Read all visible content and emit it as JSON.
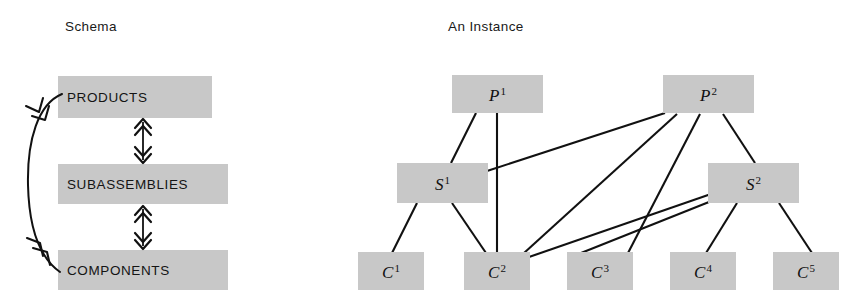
{
  "panels": [
    {
      "id": "schema",
      "title": "Schema"
    },
    {
      "id": "instance",
      "title": "An Instance"
    }
  ],
  "colors": {
    "node_fill": "#c8c8c8",
    "line": "#111111",
    "text": "#141414",
    "background": "#ffffff"
  },
  "schema": {
    "title": "Schema",
    "nodes": [
      {
        "name": "products-node",
        "label": "PRODUCTS",
        "x": 58,
        "y": 76,
        "w": 154,
        "h": 42
      },
      {
        "name": "subassemblies-node",
        "label": "SUBASSEMBLIES",
        "x": 58,
        "y": 164,
        "w": 170,
        "h": 40
      },
      {
        "name": "components-node",
        "label": "COMPONENTS",
        "x": 58,
        "y": 250,
        "w": 170,
        "h": 40
      }
    ],
    "connectors": [
      {
        "name": "products-subassemblies-connector",
        "from": "PRODUCTS",
        "to": "SUBASSEMBLIES",
        "style": "double-headed-double-chevron"
      },
      {
        "name": "subassemblies-components-connector",
        "from": "SUBASSEMBLIES",
        "to": "COMPONENTS",
        "style": "double-headed-double-chevron"
      },
      {
        "name": "products-components-connector",
        "from": "PRODUCTS",
        "to": "COMPONENTS",
        "style": "curved-double-headed-double-chevron"
      }
    ]
  },
  "instance": {
    "title": "An Instance",
    "nodes": [
      {
        "name": "node-p1",
        "letter": "P",
        "sub": "1",
        "label": "P1",
        "x": 452,
        "y": 75,
        "w": 91,
        "h": 38
      },
      {
        "name": "node-p2",
        "letter": "P",
        "sub": "2",
        "label": "P2",
        "x": 663,
        "y": 75,
        "w": 91,
        "h": 38
      },
      {
        "name": "node-s1",
        "letter": "S",
        "sub": "1",
        "label": "S1",
        "x": 397,
        "y": 163,
        "w": 91,
        "h": 40
      },
      {
        "name": "node-s2",
        "letter": "S",
        "sub": "2",
        "label": "S2",
        "x": 708,
        "y": 163,
        "w": 91,
        "h": 40
      },
      {
        "name": "node-c1",
        "letter": "C",
        "sub": "1",
        "label": "C1",
        "x": 358,
        "y": 252,
        "w": 66,
        "h": 38
      },
      {
        "name": "node-c2",
        "letter": "C",
        "sub": "2",
        "label": "C2",
        "x": 464,
        "y": 252,
        "w": 66,
        "h": 38
      },
      {
        "name": "node-c3",
        "letter": "C",
        "sub": "3",
        "label": "C3",
        "x": 567,
        "y": 252,
        "w": 66,
        "h": 38
      },
      {
        "name": "node-c4",
        "letter": "C",
        "sub": "4",
        "label": "C4",
        "x": 670,
        "y": 252,
        "w": 66,
        "h": 38
      },
      {
        "name": "node-c5",
        "letter": "C",
        "sub": "5",
        "label": "C5",
        "x": 773,
        "y": 252,
        "w": 66,
        "h": 38
      }
    ],
    "edges": [
      {
        "name": "edge-p1-s1",
        "from": "P1",
        "to": "S1",
        "x1": 476,
        "y1": 113,
        "x2": 451,
        "y2": 163
      },
      {
        "name": "edge-p1-c2",
        "from": "P1",
        "to": "C2",
        "x1": 497,
        "y1": 113,
        "x2": 497,
        "y2": 252
      },
      {
        "name": "edge-p2-s1",
        "from": "P2",
        "to": "S1",
        "x1": 665,
        "y1": 113,
        "x2": 488,
        "y2": 171
      },
      {
        "name": "edge-p2-c2",
        "from": "P2",
        "to": "C2",
        "x1": 677,
        "y1": 114,
        "x2": 524,
        "y2": 252
      },
      {
        "name": "edge-p2-c3",
        "from": "P2",
        "to": "C3",
        "x1": 700,
        "y1": 114,
        "x2": 628,
        "y2": 252
      },
      {
        "name": "edge-p2-s2",
        "from": "P2",
        "to": "S2",
        "x1": 723,
        "y1": 114,
        "x2": 755,
        "y2": 163
      },
      {
        "name": "edge-s1-c1",
        "from": "S1",
        "to": "C1",
        "x1": 417,
        "y1": 203,
        "x2": 392,
        "y2": 252
      },
      {
        "name": "edge-s1-c2",
        "from": "S1",
        "to": "C2",
        "x1": 452,
        "y1": 203,
        "x2": 485,
        "y2": 252
      },
      {
        "name": "edge-s2-c2",
        "from": "S2",
        "to": "C2",
        "x1": 710,
        "y1": 194,
        "x2": 529,
        "y2": 256
      },
      {
        "name": "edge-s2-c3",
        "from": "S2",
        "to": "C3",
        "x1": 713,
        "y1": 200,
        "x2": 575,
        "y2": 254
      },
      {
        "name": "edge-s2-c4",
        "from": "S2",
        "to": "C4",
        "x1": 737,
        "y1": 203,
        "x2": 706,
        "y2": 252
      },
      {
        "name": "edge-s2-c5",
        "from": "S2",
        "to": "C5",
        "x1": 779,
        "y1": 203,
        "x2": 812,
        "y2": 252
      }
    ]
  }
}
